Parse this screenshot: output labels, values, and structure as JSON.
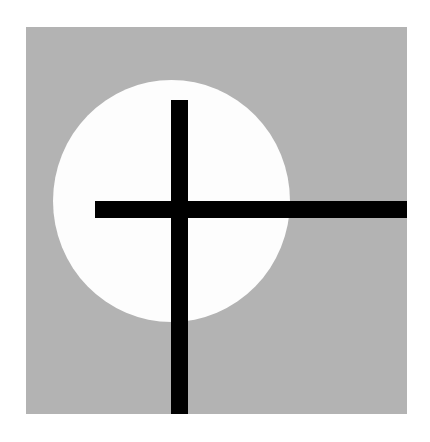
{
  "artwork": {
    "background_color": "#ffffff",
    "panel_color": "#b3b3b3",
    "circle_color": "#fdfdfd",
    "bar_color": "#000000",
    "panel": {
      "left": 26,
      "top": 27,
      "width": 381,
      "height": 387
    },
    "circle": {
      "left": 53,
      "top": 80,
      "width": 237,
      "height": 242
    },
    "vertical_bar": {
      "left": 171,
      "top": 100,
      "width": 17,
      "height": 314
    },
    "horizontal_bar": {
      "left": 95,
      "top": 201,
      "width": 312,
      "height": 17
    }
  }
}
